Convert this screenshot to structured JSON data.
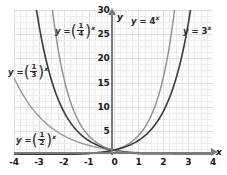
{
  "chart_data": {
    "type": "line",
    "title": "",
    "xlabel": "x",
    "ylabel": "y",
    "xlim": [
      -4,
      4
    ],
    "ylim": [
      0,
      30
    ],
    "grid": true,
    "legend_position": "inline-annotations",
    "xticks": [
      "-4",
      "-3",
      "-2",
      "-1",
      "0",
      "1",
      "2",
      "3",
      "4"
    ],
    "xtick_values": [
      -4,
      -3,
      -2,
      -1,
      0,
      1,
      2,
      3,
      4
    ],
    "yticks": [
      "5",
      "10",
      "15",
      "20",
      "25",
      "30"
    ],
    "ytick_values": [
      5,
      10,
      15,
      20,
      25,
      30
    ],
    "origin_label": "0",
    "series": [
      {
        "name": "y = (1/2)^x",
        "base": 0.5,
        "color": "#9a9a9a",
        "x": [
          -4,
          -3.5,
          -3,
          -2.5,
          -2,
          -1.5,
          -1,
          -0.5,
          0,
          0.5,
          1,
          1.5,
          2,
          2.5,
          3,
          3.5,
          4
        ],
        "values": [
          16,
          11.31,
          8,
          5.66,
          4,
          2.83,
          2,
          1.41,
          1,
          0.71,
          0.5,
          0.35,
          0.25,
          0.18,
          0.125,
          0.088,
          0.0625
        ]
      },
      {
        "name": "y = (1/3)^x",
        "base": 0.3333333,
        "color": "#3a3a3a",
        "x": [
          -3.1,
          -3,
          -2.5,
          -2,
          -1.5,
          -1,
          -0.5,
          0,
          0.5,
          1,
          1.5,
          2,
          2.5,
          3,
          3.5,
          4
        ],
        "values": [
          30.8,
          27,
          15.59,
          9,
          5.2,
          3,
          1.73,
          1,
          0.577,
          0.333,
          0.192,
          0.111,
          0.064,
          0.037,
          0.021,
          0.0123
        ]
      },
      {
        "name": "y = (1/4)^x",
        "base": 0.25,
        "color": "#8f8f8f",
        "x": [
          -2.45,
          -2.25,
          -2,
          -1.75,
          -1.5,
          -1.25,
          -1,
          -0.75,
          -0.5,
          -0.25,
          0,
          0.5,
          1,
          1.5,
          2,
          2.5,
          3,
          3.5,
          4
        ],
        "values": [
          29.9,
          22.6,
          16,
          11.3,
          8,
          5.66,
          4,
          2.83,
          2,
          1.41,
          1,
          0.5,
          0.25,
          0.125,
          0.0625,
          0.031,
          0.0156,
          0.0078,
          0.0039
        ]
      },
      {
        "name": "y = 4^x",
        "base": 4,
        "color": "#8f8f8f",
        "x": [
          -4,
          -3,
          -2,
          -1,
          0,
          0.5,
          1,
          1.5,
          2,
          2.45
        ],
        "values": [
          0.0039,
          0.0156,
          0.0625,
          0.25,
          1,
          2,
          4,
          8,
          16,
          29.9
        ]
      },
      {
        "name": "y = 3^x",
        "base": 3,
        "color": "#3a3a3a",
        "x": [
          -4,
          -3,
          -2,
          -1,
          0,
          0.5,
          1,
          1.5,
          2,
          2.5,
          3,
          3.1
        ],
        "values": [
          0.0123,
          0.037,
          0.111,
          0.333,
          1,
          1.73,
          3,
          5.2,
          9,
          15.59,
          27,
          30.8
        ]
      }
    ],
    "annotations": [
      {
        "id": "quarter",
        "text": "y = (1/4)^x",
        "base": "4",
        "kind": "fraction",
        "x": -1.75,
        "y": 26.5
      },
      {
        "id": "third",
        "text": "y = (1/3)^x",
        "base": "3",
        "kind": "fraction",
        "x": -3.65,
        "y": 18.0
      },
      {
        "id": "half",
        "text": "y = (1/2)^x",
        "base": "2",
        "kind": "fraction",
        "x": -3.3,
        "y": 3.2
      },
      {
        "id": "four",
        "text": "y = 4^x",
        "base": "4",
        "kind": "plain",
        "x": 0.8,
        "y": 28.5
      },
      {
        "id": "three",
        "text": "y = 3^x",
        "base": "3",
        "kind": "plain",
        "x": 2.9,
        "y": 26.5
      }
    ]
  },
  "labels": {
    "y_eq": "y =",
    "exponent": "x",
    "numerator": "1",
    "den_half": "2",
    "den_third": "3",
    "den_quarter": "4",
    "base_four": "4",
    "base_three": "3",
    "axis_x": "x",
    "axis_y": "y",
    "origin": "0",
    "xticks": {
      "m4": "-4",
      "m3": "-3",
      "m2": "-2",
      "m1": "-1",
      "p1": "1",
      "p2": "2",
      "p3": "3",
      "p4": "4"
    },
    "yticks": {
      "t5": "5",
      "t10": "10",
      "t15": "15",
      "t20": "20",
      "t25": "25",
      "t30": "30"
    }
  }
}
